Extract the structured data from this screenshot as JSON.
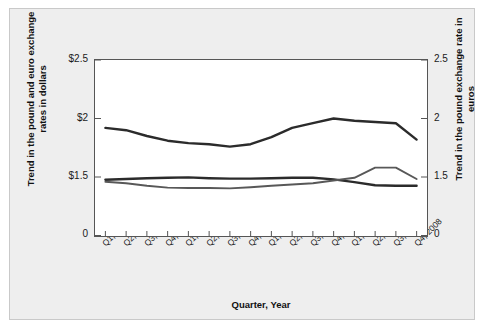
{
  "chart_data": {
    "type": "line",
    "title": "",
    "xlabel": "Quarter, Year",
    "ylabel_left": "Trend in the pound and euro exchange rates in dollars",
    "ylabel_right": "Trend in the pound exchange rate in euros",
    "categories": [
      "Q1, 2005",
      "Q2, 2005",
      "Q3, 2005",
      "Q4, 2005",
      "Q1, 2006",
      "Q2, 2006",
      "Q3, 2006",
      "Q4, 2006",
      "Q1, 2007",
      "Q2, 2007",
      "Q3, 2007",
      "Q4, 2007",
      "Q1, 2008",
      "Q2, 2008",
      "Q3, 2008",
      "Q4, 2008"
    ],
    "ytick_labels_left": [
      "$2.5",
      "$2",
      "$1.5",
      "0"
    ],
    "ytick_values_left": [
      2.5,
      2.0,
      1.5,
      0
    ],
    "ytick_labels_right": [
      "2.5",
      "2",
      "1.5",
      "0"
    ],
    "ytick_values_right": [
      2.5,
      2.0,
      1.5,
      0
    ],
    "ylim": [
      1.5,
      2.5
    ],
    "axis_broken_below": 1.5,
    "grid": false,
    "legend": "inline-annotations",
    "series": [
      {
        "name": "British Pound",
        "axis": "left",
        "color": "#2b2b2b",
        "values": [
          1.92,
          1.9,
          1.85,
          1.81,
          1.79,
          1.78,
          1.76,
          1.78,
          1.84,
          1.92,
          1.96,
          2.0,
          1.98,
          1.97,
          1.96,
          1.82
        ]
      },
      {
        "name": "Pound/Euro",
        "axis": "right",
        "color": "#2b2b2b",
        "values": [
          1.43,
          1.45,
          1.47,
          1.48,
          1.49,
          1.47,
          1.46,
          1.46,
          1.47,
          1.48,
          1.48,
          1.44,
          1.37,
          1.29,
          1.28,
          1.28
        ]
      },
      {
        "name": "Euro",
        "axis": "left",
        "color": "#585858",
        "values": [
          1.38,
          1.34,
          1.28,
          1.23,
          1.22,
          1.22,
          1.21,
          1.24,
          1.28,
          1.31,
          1.34,
          1.41,
          1.48,
          1.58,
          1.58,
          1.45
        ]
      }
    ],
    "annotations": [
      {
        "text": "British Pound",
        "x_px": 298,
        "y_px": 84
      },
      {
        "text": "Pound/Euro",
        "x_px": 247,
        "y_px": 152
      },
      {
        "text": "Euro",
        "x_px": 258,
        "y_px": 203
      }
    ]
  }
}
